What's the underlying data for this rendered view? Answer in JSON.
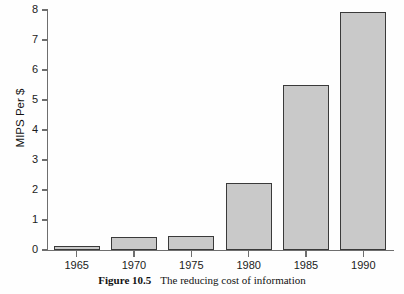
{
  "figure": {
    "caption_label": "Figure 10.5",
    "caption_text": "The reducing cost of information",
    "ghost_text_above": ""
  },
  "colors": {
    "bar_fill": "#c9c9c9",
    "bar_stroke": "#3a3a3a",
    "axis": "#6e6e6e",
    "text": "#1b1b1b",
    "background": "#fefefe"
  },
  "chart_data": {
    "type": "bar",
    "title": "",
    "subtitle": "",
    "xlabel": "",
    "ylabel": "MIPS Per $",
    "categories": [
      "1965",
      "1970",
      "1975",
      "1980",
      "1985",
      "1990"
    ],
    "values": [
      0.15,
      0.42,
      0.47,
      2.25,
      5.5,
      7.95
    ],
    "series": [
      {
        "name": "MIPS Per $",
        "values": [
          0.15,
          0.42,
          0.47,
          2.25,
          5.5,
          7.95
        ]
      }
    ],
    "ylim": [
      0,
      8
    ],
    "xlim_note": "categorical",
    "ytick_labels": [
      "0",
      "1",
      "2",
      "3",
      "4",
      "5",
      "6",
      "7",
      "8"
    ],
    "ytick_values": [
      0,
      1,
      2,
      3,
      4,
      5,
      6,
      7,
      8
    ],
    "xtick_labels": [
      "1965",
      "1970",
      "1975",
      "1980",
      "1985",
      "1990"
    ],
    "grid": false,
    "legend": null,
    "legend_position": "none",
    "annotations": []
  }
}
